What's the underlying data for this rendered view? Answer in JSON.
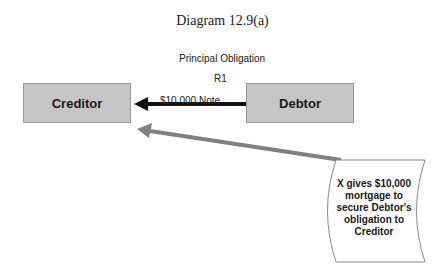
{
  "title": "Diagram 12.9(a)",
  "principal_label": "Principal Obligation",
  "relation_label": "R1",
  "note_label": "$10,000 Note",
  "nodes": {
    "creditor": "Creditor",
    "debtor": "Debtor"
  },
  "scroll": {
    "lines": [
      "X gives $10,000",
      "mortgage to",
      "secure Debtor's",
      "obligation to",
      "Creditor"
    ]
  },
  "colors": {
    "box_fill": "#c6c6c6",
    "note_arrow": "#111111",
    "mortgage_arrow": "#808080"
  }
}
